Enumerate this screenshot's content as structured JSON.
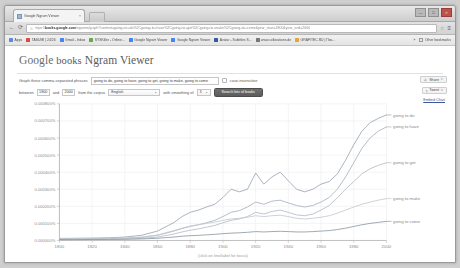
{
  "browser": {
    "tab": {
      "title": "Google Ngram Viewer",
      "close_label": "×",
      "favicon": "page-icon"
    },
    "newtab_label": "+",
    "window_controls": {
      "minimize": "—",
      "maximize": "□",
      "close": "×"
    },
    "nav": {
      "back": "←",
      "forward": "→",
      "reload": "⟳",
      "star": "☆",
      "menu": "≡"
    },
    "omnibox": {
      "lock": "🔒",
      "url_prefix": "https://",
      "url_host": "books.google.com",
      "url_path": "/ngrams/graph?content=going+to+do%2Cgoing+to+have%2Cgoing+to+get%2Cgoing+to+make%2Cgoing+to+come&year_start=1800&year_end=2000"
    },
    "bookmarks": [
      {
        "label": "Apps",
        "color": "#5b8dd6"
      },
      {
        "label": "TASUMI | 24/26",
        "color": "#d94a3d"
      },
      {
        "label": "Gmail - Inbox",
        "color": "#4285f4"
      },
      {
        "label": "SYSKiller - Online...",
        "color": "#6aa84f"
      },
      {
        "label": "Google Ngram Viewer",
        "color": "#4285f4"
      },
      {
        "label": "Google Ngram Viewer",
        "color": "#4285f4"
      },
      {
        "label": "Avatar - Subtitles  S...",
        "color": "#3b5998"
      },
      {
        "label": "www.collorations.de",
        "color": "#777777"
      },
      {
        "label": "GRAFITEC.RU | Поч...",
        "color": "#e8a33d"
      }
    ],
    "bookmarks_overflow": "»",
    "other_bookmarks": "Other bookmarks"
  },
  "page": {
    "title_google": "Google",
    "title_books": " books",
    "title_rest": " Ngram Viewer",
    "controls": {
      "phrase_label": "Graph these comma-separated phrases",
      "phrase_value": "going to do, going to have, going to get, going to make, going to come",
      "case_insensitive_label": "case-insensitive",
      "between_label": "between",
      "year_start": "1800",
      "and_label": "and",
      "year_end": "2000",
      "corpus_label": "from the corpus",
      "corpus_value": "English",
      "smoothing_label": "with smoothing of",
      "smoothing_value": "3",
      "search_button": "Search lots of books"
    },
    "side": {
      "share_label": "Share",
      "share_icon": "share-icon",
      "tweet_label": "Tweet",
      "tweet_icon": "twitter-icon",
      "embed_label": "Embed Chart",
      "more_caret": "▾"
    }
  },
  "chart_data": {
    "type": "line",
    "title": "",
    "xlabel": "(click on line/label for focus)",
    "ylabel": "",
    "grid": true,
    "legend_position": "right-inline",
    "xlim": [
      1800,
      2000
    ],
    "ylim": [
      0,
      0.0008
    ],
    "xticks": [
      "1800",
      "1820",
      "1840",
      "1860",
      "1880",
      "1900",
      "1920",
      "1940",
      "1960",
      "1980",
      "2000"
    ],
    "yticks": [
      "0.000800%",
      "0.000700%",
      "0.000600%",
      "0.000500%",
      "0.000400%",
      "0.000300%",
      "0.000200%",
      "0.000100%",
      "0.000000%"
    ],
    "x": [
      1800,
      1810,
      1820,
      1830,
      1840,
      1850,
      1860,
      1870,
      1875,
      1880,
      1885,
      1890,
      1895,
      1900,
      1905,
      1910,
      1915,
      1920,
      1925,
      1930,
      1935,
      1940,
      1945,
      1950,
      1955,
      1960,
      1965,
      1970,
      1975,
      1980,
      1985,
      1990,
      1995,
      2000
    ],
    "series": [
      {
        "name": "going to do",
        "color": "#9aa6b4",
        "values": [
          1.2e-05,
          1.3e-05,
          1.4e-05,
          1.6e-05,
          2e-05,
          3e-05,
          5.5e-05,
          0.000105,
          0.00014,
          0.000165,
          0.000178,
          0.000196,
          0.000212,
          0.000252,
          0.0003,
          0.000285,
          0.0003,
          0.000395,
          0.00033,
          0.000372,
          0.0004,
          0.00035,
          0.0003,
          0.000285,
          0.0003,
          0.00033,
          0.000345,
          0.00039,
          0.00047,
          0.00056,
          0.00064,
          0.00069,
          0.000715,
          0.000735
        ]
      },
      {
        "name": "going to have",
        "color": "#a7b1bd",
        "values": [
          8e-06,
          9e-06,
          1e-05,
          1.1e-05,
          1.3e-05,
          1.8e-05,
          3e-05,
          5.5e-05,
          7e-05,
          8.2e-05,
          9.2e-05,
          0.000104,
          0.000118,
          0.00014,
          0.000165,
          0.000175,
          0.000196,
          0.000225,
          0.000212,
          0.00023,
          0.000236,
          0.00022,
          0.000205,
          0.000196,
          0.000205,
          0.000225,
          0.000252,
          0.0003,
          0.000372,
          0.000455,
          0.00054,
          0.0006,
          0.00064,
          0.000665
        ]
      },
      {
        "name": "going to get",
        "color": "#b4bcc6",
        "values": [
          6e-06,
          6e-06,
          7e-06,
          8e-06,
          9e-06,
          1.2e-05,
          2e-05,
          3.8e-05,
          5e-05,
          6e-05,
          6.8e-05,
          7.8e-05,
          8.8e-05,
          0.000104,
          0.000118,
          0.000126,
          0.00014,
          0.000165,
          0.000155,
          0.00017,
          0.000178,
          0.000165,
          0.00015,
          0.000145,
          0.000155,
          0.000178,
          0.000205,
          0.00025,
          0.0003,
          0.000345,
          0.00039,
          0.00042,
          0.00044,
          0.000455
        ]
      },
      {
        "name": "going to make",
        "color": "#c3c9d1",
        "values": [
          1e-05,
          1.1e-05,
          1.2e-05,
          1.3e-05,
          1.5e-05,
          2e-05,
          3.2e-05,
          5.8e-05,
          7.2e-05,
          8.5e-05,
          9.2e-05,
          0.0001,
          0.000108,
          0.000118,
          0.000126,
          0.00013,
          0.000136,
          0.000145,
          0.00014,
          0.000145,
          0.000148,
          0.00014,
          0.00013,
          0.000126,
          0.00013,
          0.000136,
          0.000145,
          0.00016,
          0.000178,
          0.000196,
          0.000212,
          0.000225,
          0.000236,
          0.000245
        ]
      },
      {
        "name": "going to come",
        "color": "#8e98a4",
        "values": [
          5e-06,
          5e-06,
          6e-06,
          6e-06,
          7e-06,
          9e-06,
          1.3e-05,
          2e-05,
          2.5e-05,
          2.8e-05,
          3e-05,
          3.3e-05,
          3.6e-05,
          4e-05,
          4.3e-05,
          4.5e-05,
          4.8e-05,
          5.2e-05,
          5e-05,
          5.2e-05,
          5.4e-05,
          5.2e-05,
          5e-05,
          5e-05,
          5.2e-05,
          5.5e-05,
          5.8e-05,
          6.4e-05,
          7.2e-05,
          8.2e-05,
          9.2e-05,
          0.0001,
          0.000106,
          0.000112
        ]
      }
    ]
  }
}
